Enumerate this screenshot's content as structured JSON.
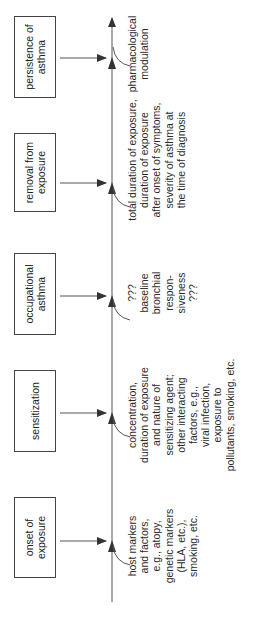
{
  "diagram": {
    "type": "timeline-flow",
    "orientation": "rotated-90-ccw",
    "stages": [
      {
        "id": "onset",
        "label": "onset of exposure",
        "note": "host markers\nand factors,\ne.g., atopy,\ngenetic markers\n(HLA, etc.),\nsmoking, etc."
      },
      {
        "id": "sensitization",
        "label": "sensitization",
        "note": "concentration,\nduration of exposure\nand nature of\nsensitizing agent;\nother interacting\nfactors, e.g.,\nviral infection,\nexposure to\npollutants, smoking, etc."
      },
      {
        "id": "occupational",
        "label": "occupational asthma",
        "note": "???\nbaseline\nbronchial\nrespon-\nsiveness\n???"
      },
      {
        "id": "removal",
        "label": "removal from exposure",
        "note": "total duration of exposure,\nduration of exposure\nafter onset of symptoms,\nseverity of asthma at\nthe time of diagnosis"
      },
      {
        "id": "persistence",
        "label": "persistence of asthma",
        "note": "pharmacological\nmodulation"
      }
    ],
    "colors": {
      "line": "#444444",
      "box_border": "#444444",
      "text": "#2a2a2a",
      "background": "#ffffff"
    }
  }
}
